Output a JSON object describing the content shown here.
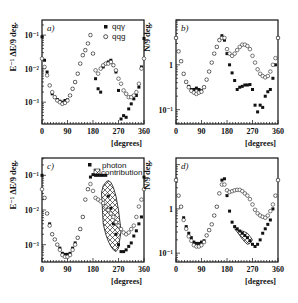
{
  "chart_data": [
    {
      "id": "a",
      "type": "scatter",
      "panel_label": "a)",
      "ylabel": "E⁻¹ ΔE/9 deg.",
      "xlabel": "[degrees]",
      "xlim": [
        0,
        360
      ],
      "x_ticks": [
        "0",
        "90",
        "180",
        "270",
        "360"
      ],
      "y_scale": "log",
      "y_ticks": [
        "10⁻¹",
        "10⁻²",
        "10⁻³"
      ],
      "ylim_log10": [
        -3.65,
        -0.55
      ],
      "legend": [
        {
          "marker": "filled-circle",
          "label": "qqγ"
        },
        {
          "marker": "open-circle",
          "label": "qqg"
        }
      ],
      "series": [
        {
          "name": "qqγ",
          "marker": "filled",
          "x": [
            0,
            9,
            18,
            27,
            36,
            45,
            54,
            63,
            72,
            81,
            90,
            99,
            108,
            117,
            126,
            135,
            144,
            153,
            162,
            171,
            180,
            189,
            198,
            207,
            216,
            225,
            234,
            243,
            252,
            261,
            270,
            279,
            288,
            297,
            306,
            315,
            324,
            333,
            342,
            351,
            360
          ],
          "log_y": [
            -1.05,
            -1.75,
            -2.1,
            -2.5,
            -2.75,
            -2.85,
            -2.92,
            -2.97,
            -3.0,
            -2.95,
            -2.93,
            -2.8,
            -2.6,
            -2.4,
            -2.15,
            -1.85,
            -1.6,
            -1.45,
            -1.25,
            -1.0,
            -1.55,
            -2.3,
            -2.6,
            -2.7,
            -1.95,
            -1.85,
            -1.8,
            -1.75,
            -1.9,
            -2.1,
            -2.65,
            -3.5,
            -3.4,
            -3.45,
            -3.2,
            -3.05,
            -2.9,
            -2.8,
            -2.55,
            -1.95,
            -1.1
          ]
        },
        {
          "name": "qqg",
          "marker": "open",
          "x": [
            0,
            9,
            18,
            27,
            36,
            45,
            54,
            63,
            72,
            81,
            90,
            99,
            108,
            117,
            126,
            135,
            144,
            153,
            162,
            171,
            180,
            189,
            198,
            207,
            216,
            225,
            234,
            243,
            252,
            261,
            270,
            279,
            288,
            297,
            306,
            315,
            324,
            333,
            342,
            351,
            360
          ],
          "log_y": [
            -1.7,
            -1.95,
            -2.2,
            -2.5,
            -2.7,
            -2.85,
            -2.95,
            -3.0,
            -3.05,
            -3.02,
            -2.95,
            -2.8,
            -2.6,
            -2.4,
            -2.15,
            -1.85,
            -1.6,
            -1.45,
            -1.25,
            -1.0,
            -1.55,
            -2.05,
            -2.15,
            -2.0,
            -1.9,
            -1.85,
            -1.85,
            -1.8,
            -1.9,
            -2.05,
            -2.3,
            -2.45,
            -2.65,
            -2.75,
            -2.85,
            -2.85,
            -2.8,
            -2.7,
            -2.45,
            -2.0,
            -1.7
          ]
        }
      ]
    },
    {
      "id": "b",
      "type": "scatter",
      "panel_label": "b)",
      "ylabel": "N/9 deg.",
      "xlabel": "[degrees]",
      "xlim": [
        0,
        360
      ],
      "x_ticks": [
        "0",
        "90",
        "180",
        "270",
        "360"
      ],
      "y_scale": "log",
      "y_ticks": [
        "1",
        "10⁻¹"
      ],
      "ylim_log10": [
        -1.32,
        1.0
      ],
      "series": [
        {
          "name": "qqγ",
          "marker": "filled",
          "x": [
            0,
            9,
            18,
            27,
            36,
            45,
            54,
            63,
            72,
            81,
            90,
            99,
            108,
            117,
            126,
            135,
            144,
            153,
            162,
            171,
            180,
            189,
            198,
            207,
            216,
            225,
            234,
            243,
            252,
            261,
            270,
            279,
            288,
            297,
            306,
            315,
            324,
            333,
            342,
            351,
            360
          ],
          "log_y": [
            0.6,
            0.3,
            0.08,
            -0.2,
            -0.38,
            -0.48,
            -0.55,
            -0.55,
            -0.52,
            -0.55,
            -0.58,
            -0.5,
            -0.33,
            -0.15,
            0.05,
            0.25,
            0.4,
            0.55,
            0.65,
            0.55,
            0.25,
            0.0,
            -0.18,
            -0.35,
            -0.55,
            -0.5,
            -0.48,
            -0.45,
            -0.45,
            -0.44,
            -0.55,
            -0.9,
            -1.05,
            -0.9,
            -0.95,
            -0.7,
            -0.6,
            -0.55,
            -0.3,
            0.0,
            0.6
          ]
        },
        {
          "name": "qqg",
          "marker": "open",
          "x": [
            0,
            9,
            18,
            27,
            36,
            45,
            54,
            63,
            72,
            81,
            90,
            99,
            108,
            117,
            126,
            135,
            144,
            153,
            162,
            171,
            180,
            189,
            198,
            207,
            216,
            225,
            234,
            243,
            252,
            261,
            270,
            279,
            288,
            297,
            306,
            315,
            324,
            333,
            342,
            351,
            360
          ],
          "log_y": [
            0.6,
            0.3,
            0.08,
            -0.2,
            -0.38,
            -0.5,
            -0.58,
            -0.62,
            -0.65,
            -0.62,
            -0.6,
            -0.5,
            -0.33,
            -0.15,
            0.05,
            0.25,
            0.4,
            0.55,
            0.6,
            0.6,
            0.35,
            0.25,
            0.2,
            0.25,
            0.33,
            0.4,
            0.45,
            0.45,
            0.42,
            0.35,
            0.2,
            0.05,
            -0.1,
            -0.2,
            -0.25,
            -0.28,
            -0.25,
            -0.15,
            0.0,
            0.15,
            0.6
          ]
        }
      ]
    },
    {
      "id": "c",
      "type": "scatter",
      "panel_label": "c)",
      "ylabel": "E⁻¹ ΔE/9 deg.",
      "xlabel": "[degrees]",
      "xlim": [
        0,
        360
      ],
      "x_ticks": [
        "0",
        "90",
        "180",
        "270",
        "360"
      ],
      "y_scale": "log",
      "y_ticks": [
        "10⁻¹",
        "10⁻²",
        "10⁻³"
      ],
      "ylim_log10": [
        -3.5,
        -0.5
      ],
      "legend": [
        {
          "marker": "filled-circle",
          "label": ""
        },
        {
          "marker": "hatched-box",
          "label": "photon contribution"
        }
      ],
      "series": [
        {
          "name": "qqγ",
          "marker": "filled",
          "x": [
            0,
            9,
            18,
            27,
            36,
            45,
            54,
            63,
            72,
            81,
            90,
            99,
            108,
            117,
            126,
            135,
            144,
            153,
            162,
            171,
            180,
            189,
            198,
            207,
            216,
            225,
            234,
            243,
            252,
            261,
            270,
            279,
            288,
            297,
            306,
            315,
            324,
            333,
            342,
            351,
            360
          ],
          "log_y": [
            -1.0,
            -1.65,
            -2.1,
            -2.4,
            -2.7,
            -2.85,
            -3.0,
            -3.1,
            -3.25,
            -3.28,
            -3.28,
            -3.25,
            -3.1,
            -2.95,
            -2.8,
            -2.55,
            -2.2,
            -1.7,
            -1.4,
            -1.05,
            -0.98,
            -1.0,
            -1.0,
            -1.0,
            -1.0,
            -1.0,
            -1.6,
            -1.95,
            -2.4,
            -2.7,
            -3.0,
            -3.2,
            -3.2,
            -3.15,
            -3.05,
            -2.95,
            -2.75,
            -2.6,
            -2.4,
            -2.2,
            -1.05
          ]
        },
        {
          "name": "qqg",
          "marker": "open",
          "x": [
            0,
            9,
            18,
            27,
            36,
            45,
            54,
            63,
            72,
            81,
            90,
            99,
            108,
            117,
            126,
            135,
            144,
            153,
            162,
            171,
            180,
            189,
            198,
            207,
            216,
            225,
            234,
            243,
            252,
            261,
            270,
            279,
            288,
            297,
            306,
            315,
            324,
            333,
            342,
            351,
            360
          ],
          "log_y": [
            -1.4,
            -1.65,
            -2.1,
            -2.45,
            -2.7,
            -2.85,
            -3.0,
            -3.15,
            -3.3,
            -3.35,
            -3.35,
            -3.3,
            -3.15,
            -3.0,
            -2.8,
            -2.55,
            -2.2,
            -1.7,
            -1.4,
            -1.25,
            -1.45,
            -1.65,
            -1.7,
            -1.75,
            -1.8,
            -1.9,
            -2.0,
            -2.1,
            -2.2,
            -2.35,
            -2.45,
            -2.55,
            -2.65,
            -2.7,
            -2.65,
            -2.55,
            -2.45,
            -2.2,
            -1.9,
            -1.7,
            -1.4
          ]
        }
      ],
      "photon_region": {
        "x": [
          210,
          216,
          225,
          234,
          243,
          252,
          261,
          270,
          279,
          270,
          261,
          252,
          243,
          234,
          225,
          216,
          210
        ],
        "log_y_upper": [
          -1.5,
          -1.3,
          -1.2,
          -1.15,
          -1.2,
          -1.35,
          -1.6,
          -2.0,
          -2.6
        ],
        "log_y_lower": [
          -2.6,
          -3.1,
          -3.2,
          -3.15,
          -3.05,
          -2.9,
          -2.7,
          -2.4,
          -1.5
        ]
      }
    },
    {
      "id": "d",
      "type": "scatter",
      "panel_label": "d)",
      "ylabel": "N/9 deg.",
      "xlabel": "[degrees]",
      "xlim": [
        0,
        360
      ],
      "x_ticks": [
        "0",
        "90",
        "180",
        "270",
        "360"
      ],
      "y_scale": "log",
      "y_ticks": [
        "1",
        "10⁻¹"
      ],
      "ylim_log10": [
        -1.2,
        1.15
      ],
      "series": [
        {
          "name": "qqγ",
          "marker": "filled",
          "x": [
            0,
            9,
            18,
            27,
            36,
            45,
            54,
            63,
            72,
            81,
            90,
            99,
            108,
            117,
            126,
            135,
            144,
            153,
            162,
            171,
            180,
            189,
            198,
            207,
            216,
            225,
            234,
            243,
            252,
            261,
            270,
            279,
            288,
            297,
            306,
            315,
            324,
            333,
            342,
            351,
            360
          ],
          "log_y": [
            0.65,
            0.3,
            0.05,
            -0.2,
            -0.4,
            -0.55,
            -0.65,
            -0.75,
            -0.78,
            -0.78,
            -0.75,
            -0.72,
            -0.6,
            -0.48,
            -0.35,
            -0.15,
            0.05,
            0.35,
            0.65,
            0.68,
            0.3,
            -0.05,
            -0.3,
            -0.4,
            -0.45,
            -0.5,
            -0.55,
            -0.6,
            -0.65,
            -0.72,
            -0.8,
            -0.85,
            -0.8,
            -0.7,
            -0.55,
            -0.45,
            -0.35,
            -0.25,
            0.0,
            0.3,
            0.65
          ]
        },
        {
          "name": "qqg",
          "marker": "open",
          "x": [
            0,
            9,
            18,
            27,
            36,
            45,
            54,
            63,
            72,
            81,
            90,
            99,
            108,
            117,
            126,
            135,
            144,
            153,
            162,
            171,
            180,
            189,
            198,
            207,
            216,
            225,
            234,
            243,
            252,
            261,
            270,
            279,
            288,
            297,
            306,
            315,
            324,
            333,
            342,
            351,
            360
          ],
          "log_y": [
            0.65,
            0.3,
            0.05,
            -0.25,
            -0.45,
            -0.62,
            -0.72,
            -0.82,
            -0.85,
            -0.85,
            -0.82,
            -0.75,
            -0.6,
            -0.48,
            -0.35,
            -0.15,
            0.05,
            0.35,
            0.55,
            0.55,
            0.42,
            0.38,
            0.4,
            0.42,
            0.43,
            0.43,
            0.4,
            0.35,
            0.3,
            0.22,
            0.1,
            -0.02,
            -0.1,
            -0.15,
            -0.18,
            -0.2,
            -0.15,
            -0.05,
            0.1,
            0.3,
            0.65
          ]
        }
      ],
      "photon_region": {
        "x": [
          207,
          216,
          225,
          234,
          243,
          252,
          261,
          270,
          261,
          252,
          243,
          234,
          225,
          216,
          207
        ],
        "log_y_upper": [
          -0.45,
          -0.48,
          -0.5,
          -0.5,
          -0.52,
          -0.55,
          -0.62,
          -0.7
        ],
        "log_y_lower": [
          -0.7,
          -0.78,
          -0.8,
          -0.75,
          -0.68,
          -0.6,
          -0.52,
          -0.45
        ]
      }
    }
  ],
  "layout": {
    "panels": {
      "a": {
        "x0": 42,
        "x1": 144,
        "y0": 20,
        "y1": 124
      },
      "b": {
        "x0": 176,
        "x1": 278,
        "y0": 20,
        "y1": 124
      },
      "c": {
        "x0": 42,
        "x1": 144,
        "y0": 158,
        "y1": 262
      },
      "d": {
        "x0": 176,
        "x1": 278,
        "y0": 158,
        "y1": 262
      }
    }
  }
}
